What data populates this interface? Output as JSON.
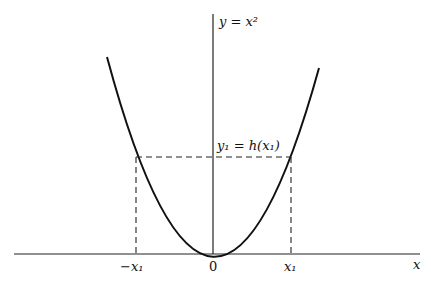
{
  "diagram": {
    "curve_label": "y = x²",
    "point_label": "y₁ = h(x₁)",
    "x_axis_label": "x",
    "ticks": {
      "neg_x1": "−x₁",
      "origin": "0",
      "pos_x1": "x₁"
    },
    "colors": {
      "stroke": "#111111",
      "background": "#ffffff"
    }
  }
}
